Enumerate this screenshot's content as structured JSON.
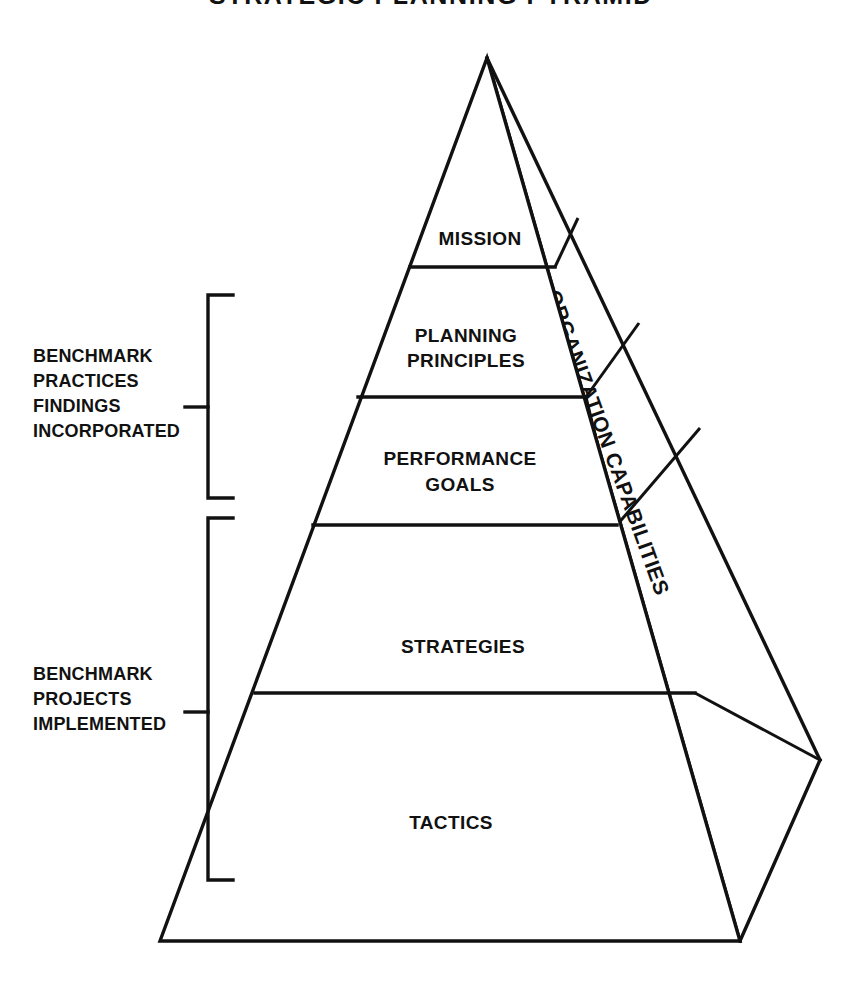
{
  "document": {
    "title": "STRATEGIC PLANNING PYRAMID",
    "type": "pyramid-diagram"
  },
  "pyramid": {
    "tiers": [
      {
        "id": "mission",
        "label": "MISSION",
        "lines": [
          "MISSION"
        ]
      },
      {
        "id": "principles",
        "label": "PLANNING PRINCIPLES",
        "lines": [
          "PLANNING",
          "PRINCIPLES"
        ]
      },
      {
        "id": "goals",
        "label": "PERFORMANCE GOALS",
        "lines": [
          "PERFORMANCE",
          "GOALS"
        ]
      },
      {
        "id": "strategies",
        "label": "STRATEGIES",
        "lines": [
          "STRATEGIES"
        ]
      },
      {
        "id": "tactics",
        "label": "TACTICS",
        "lines": [
          "TACTICS"
        ]
      }
    ],
    "side_face_label": "ORGANIZATION CAPABILITIES"
  },
  "brackets": [
    {
      "id": "upper",
      "lines": [
        "BENCHMARK",
        "PRACTICES",
        "FINDINGS",
        "INCORPORATED"
      ],
      "covers": [
        "MISSION",
        "PLANNING PRINCIPLES",
        "PERFORMANCE GOALS"
      ]
    },
    {
      "id": "lower",
      "lines": [
        "BENCHMARK",
        "PROJECTS",
        "IMPLEMENTED"
      ],
      "covers": [
        "STRATEGIES",
        "TACTICS"
      ]
    }
  ],
  "style": {
    "ink": "#111111",
    "paper": "#ffffff"
  }
}
